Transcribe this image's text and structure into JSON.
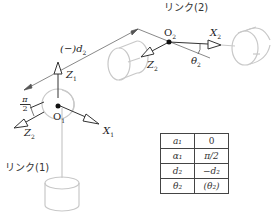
{
  "labels": {
    "link1": "リンク(1)",
    "link2": "リンク(2)",
    "offset": "(−)d",
    "offset_sub": "2",
    "z1": "Z",
    "z1_sub": "1",
    "x1": "X",
    "x1_sub": "1",
    "o1": "O",
    "o1_sub": "1",
    "z2": "Z",
    "z2_sub": "2",
    "x2": "X",
    "x2_sub": "2",
    "o2": "O",
    "o2_sub": "2",
    "theta2": "θ",
    "theta2_sub": "2",
    "alpha_num": "π",
    "alpha_den": "2"
  },
  "table": {
    "rows": [
      {
        "param": "a₁",
        "value": "0"
      },
      {
        "param": "α₁",
        "value": "π/2"
      },
      {
        "param": "d₂",
        "value": "−d₂"
      },
      {
        "param": "θ₂",
        "value": "(θ₂)"
      }
    ]
  }
}
